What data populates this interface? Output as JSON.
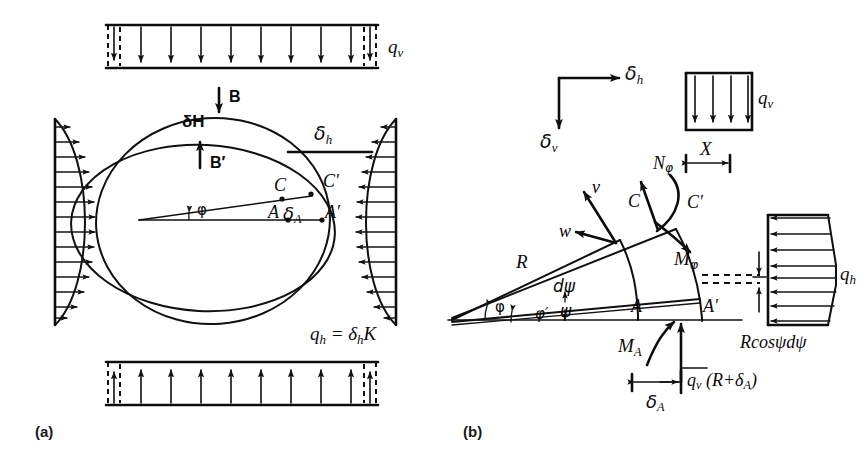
{
  "figure": {
    "panels": [
      {
        "id": "a",
        "label": "(a)",
        "caption": "Deformed ring with vertical and horizontal soil pressures"
      },
      {
        "id": "b",
        "label": "(b)",
        "caption": "Free-body of differential wedge element"
      }
    ],
    "colors": {
      "ink": "#101010",
      "background": "#ffffff"
    }
  },
  "panel_a": {
    "label": "(a)",
    "loads": {
      "top_label": "q",
      "top_label_sub": "v",
      "bottom_label": "q",
      "bottom_label_sub": "v",
      "top_arrow_count": 10,
      "bottom_arrow_count": 10,
      "side_arrow_count": 13,
      "horizontal_pressure_equation": "q",
      "horizontal_pressure_sub": "h",
      "horizontal_pressure_rhs": " = δ",
      "horizontal_pressure_rhs_sub": "h",
      "horizontal_pressure_rhs_tail": "K"
    },
    "annotations": [
      {
        "name": "crown-point",
        "text": "B"
      },
      {
        "name": "crown-deflection",
        "text": "δH"
      },
      {
        "name": "invert-point",
        "text": "B′"
      },
      {
        "name": "springline-horizontal-deflection",
        "text": "δ"
      },
      {
        "name": "springline-horizontal-deflection-sub",
        "text": "h"
      },
      {
        "name": "point-c",
        "text": "C"
      },
      {
        "name": "point-c-prime",
        "text": "C′"
      },
      {
        "name": "point-a",
        "text": "A"
      },
      {
        "name": "point-a-prime",
        "text": "A′"
      },
      {
        "name": "radial-deflection",
        "text": "δ"
      },
      {
        "name": "radial-deflection-sub",
        "text": "A"
      },
      {
        "name": "angle-phi",
        "text": "φ"
      }
    ]
  },
  "panel_b": {
    "label": "(b)",
    "axes_legend": {
      "horizontal": "δ",
      "horizontal_sub": "h",
      "vertical": "δ",
      "vertical_sub": "v"
    },
    "load_box": {
      "label": "q",
      "label_sub": "v",
      "arrow_count": 4
    },
    "dimension_x": {
      "label": "X",
      "force_label": "N",
      "force_label_sub": "φ"
    },
    "wedge": {
      "radius_label": "R",
      "angle_phi": "φ",
      "angle_phi_prime": "φ′",
      "angle_dpsi": "dψ",
      "angle_psi": "ψ",
      "displacement_v": "v",
      "displacement_w": "w",
      "point_c": "C",
      "point_c_prime": "C′",
      "point_a": "A",
      "point_a_prime": "A′",
      "moment_phi": "M",
      "moment_phi_sub": "φ",
      "moment_a": "M",
      "moment_a_sub": "A"
    },
    "right_pressure": {
      "label": "q",
      "label_sub": "h",
      "arc_label": "Rcosψdψ",
      "arrow_count_upper": 5,
      "arrow_count_lower": 4
    },
    "bottom_reaction": {
      "label": "q",
      "label_sub": "v",
      "label_tail": " (R+δ",
      "label_tail_sub": "A",
      "label_close": ")",
      "dimension_label": "δ",
      "dimension_label_sub": "A"
    }
  }
}
